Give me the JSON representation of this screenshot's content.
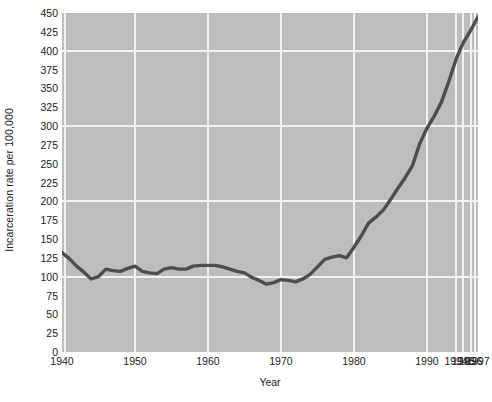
{
  "chart_data": {
    "type": "line",
    "title": "",
    "xlabel": "Year",
    "ylabel": "Incarceration rate per 100,000",
    "xlim": [
      1940,
      1997
    ],
    "ylim": [
      0,
      450
    ],
    "grid": true,
    "legend": false,
    "legend_position": "none",
    "line_color": "#4d4d4d",
    "plot_background": "#bdbdbd",
    "grid_color": "#f2f2f2",
    "page_background": "#ffffff",
    "ytick_labels": [
      "450",
      "425",
      "400",
      "375",
      "350",
      "325",
      "300",
      "275",
      "250",
      "225",
      "200",
      "175",
      "150",
      "125",
      "100",
      "75",
      "50",
      "25",
      "0"
    ],
    "ytick_values": [
      450,
      425,
      400,
      375,
      350,
      325,
      300,
      275,
      250,
      225,
      200,
      175,
      150,
      125,
      100,
      75,
      50,
      25,
      0
    ],
    "ygrid_major_values": [
      400,
      300,
      200,
      100
    ],
    "xtick_labels": [
      "1940",
      "1950",
      "1960",
      "1970",
      "1980",
      "1990",
      "1994",
      "1995",
      "1996",
      "1997"
    ],
    "xtick_values": [
      1940,
      1950,
      1960,
      1970,
      1980,
      1990,
      1994,
      1995,
      1996,
      1997
    ],
    "xgrid_values": [
      1940,
      1950,
      1960,
      1970,
      1980,
      1990,
      1994,
      1995,
      1996,
      1997
    ],
    "x": [
      1940,
      1941,
      1942,
      1943,
      1944,
      1945,
      1946,
      1947,
      1948,
      1949,
      1950,
      1951,
      1952,
      1953,
      1954,
      1955,
      1956,
      1957,
      1958,
      1959,
      1960,
      1961,
      1962,
      1963,
      1964,
      1965,
      1966,
      1967,
      1968,
      1969,
      1970,
      1971,
      1972,
      1973,
      1974,
      1975,
      1976,
      1977,
      1978,
      1979,
      1980,
      1981,
      1982,
      1983,
      1984,
      1985,
      1986,
      1987,
      1988,
      1989,
      1990,
      1991,
      1992,
      1993,
      1994,
      1995,
      1996,
      1997
    ],
    "y": [
      132,
      124,
      114,
      106,
      97,
      100,
      110,
      108,
      107,
      111,
      114,
      107,
      105,
      104,
      110,
      112,
      110,
      110,
      114,
      115,
      115,
      115,
      113,
      110,
      107,
      105,
      99,
      95,
      90,
      92,
      96,
      95,
      93,
      97,
      103,
      113,
      123,
      126,
      128,
      125,
      139,
      154,
      171,
      179,
      188,
      202,
      217,
      231,
      247,
      276,
      297,
      313,
      332,
      359,
      389,
      411,
      427,
      445
    ],
    "note": "Single series line showing US incarceration rate per 100,000 population, 1940-1997. Flat near 100-115 through 1940s-1960s, dips to ~90 around 1968-1972, then rises steeply from 1980 onward to ~445 in 1997."
  },
  "axes": {
    "y_title": "Incarceration rate per 100,000",
    "x_title": "Year"
  }
}
